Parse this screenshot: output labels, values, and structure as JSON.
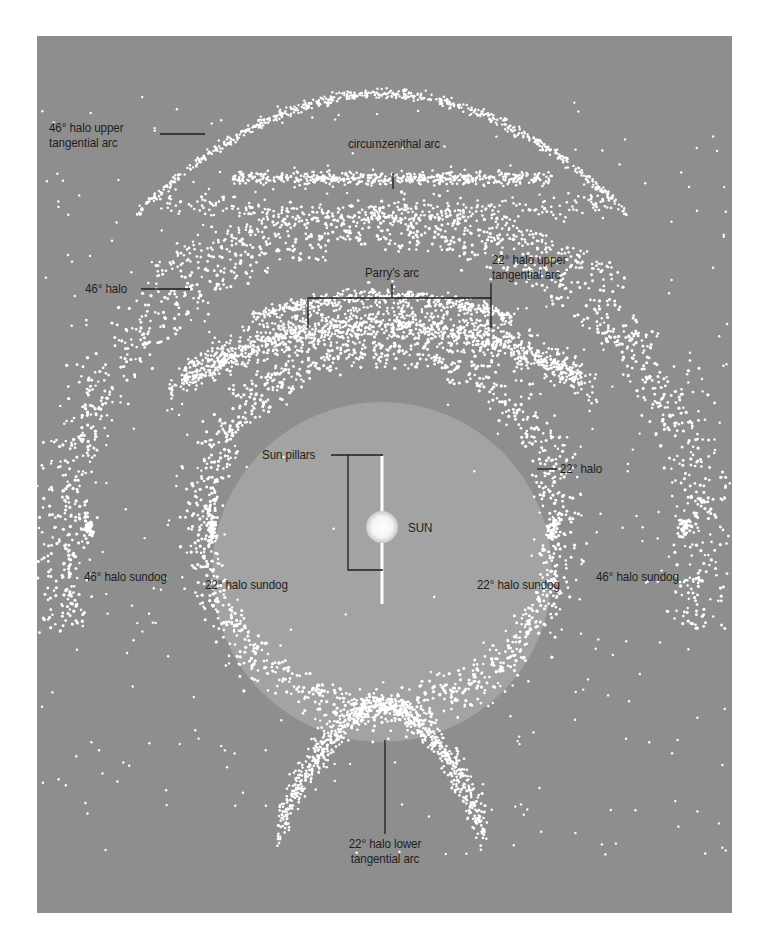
{
  "diagram": {
    "colors": {
      "background": "#8e8e8e",
      "inner_disc": "#a3a3a3",
      "crystal_dots": "#ffffff",
      "leader_lines": "#1e1e1e",
      "label_text": "#1e1e1e"
    },
    "center": {
      "label": "SUN"
    },
    "labels": {
      "circumzenithal_arc": "circumzenithal arc",
      "halo46_upper_tangential_line1": "46° halo upper",
      "halo46_upper_tangential_line2": "tangential arc",
      "halo46": "46° halo",
      "parrys_arc": "Parry's arc",
      "halo22_upper_tangential_line1": "22° halo upper",
      "halo22_upper_tangential_line2": "tangential arc",
      "sun_pillars": "Sun pillars",
      "sun": "SUN",
      "halo22": "22° halo",
      "halo46_sundog_left": "46° halo sundog",
      "halo22_sundog_left": "22° halo sundog",
      "halo22_sundog_right": "22° halo sundog",
      "halo46_sundog_right": "46° halo sundog",
      "halo22_lower_tangential_line1": "22° halo lower",
      "halo22_lower_tangential_line2": "tangential arc"
    }
  }
}
